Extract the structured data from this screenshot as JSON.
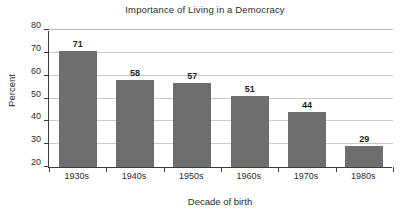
{
  "chart_data": {
    "type": "bar",
    "title": "Importance of Living in a Democracy",
    "xlabel": "Decade of birth",
    "ylabel": "Percent",
    "categories": [
      "1930s",
      "1940s",
      "1950s",
      "1960s",
      "1970s",
      "1980s"
    ],
    "values": [
      71,
      58,
      57,
      51,
      44,
      29
    ],
    "ylim": [
      20,
      80
    ],
    "ytick_step": 10,
    "yticks": [
      80,
      70,
      60,
      50,
      40,
      30,
      20
    ],
    "ytick_labels": [
      "80",
      "70",
      "60",
      "50",
      "40",
      "30",
      "20"
    ],
    "value_labels": [
      "71",
      "58",
      "57",
      "51",
      "44",
      "29"
    ],
    "grid": true,
    "grid_axis": "y",
    "legend": false,
    "legend_position": "none",
    "series": [
      {
        "name": "Percent",
        "values": [
          71,
          58,
          57,
          51,
          44,
          29
        ]
      }
    ],
    "colors": {
      "bar": "#6e6e6e",
      "gridline": "#c8c8c8",
      "axis": "#3c3c3c",
      "text": "#2b2b2b",
      "background": "#ffffff"
    }
  }
}
